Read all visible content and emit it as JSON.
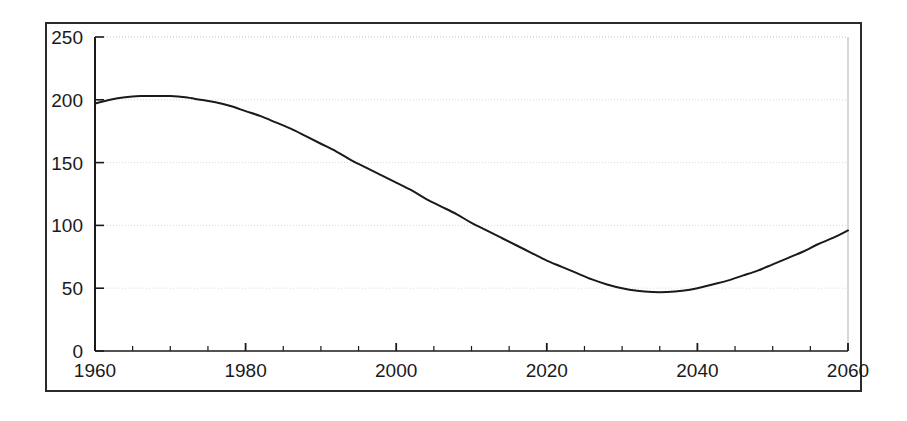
{
  "chart_data": {
    "type": "line",
    "title": "",
    "subtitle": "",
    "xlabel": "",
    "ylabel": "",
    "xlim": [
      1960,
      2060
    ],
    "ylim": [
      0,
      250
    ],
    "grid": true,
    "legend": null,
    "legend_position": "none",
    "x_major_ticks": [
      1960,
      1980,
      2000,
      2020,
      2040,
      2060
    ],
    "x_major_tick_labels": [
      "1960",
      "1980",
      "2000",
      "2020",
      "2040",
      "2060"
    ],
    "x_minor_tick_step": 5,
    "y_major_ticks": [
      0,
      50,
      100,
      150,
      200,
      250
    ],
    "y_major_tick_labels": [
      "0",
      "50",
      "100",
      "150",
      "200",
      "250"
    ],
    "gridline_values": [
      50,
      100,
      150,
      200,
      250
    ],
    "line_color": "#1a1a1a",
    "line_width": 2,
    "series": [
      {
        "name": "series-1",
        "x": [
          1960,
          1962,
          1964,
          1966,
          1968,
          1970,
          1972,
          1974,
          1976,
          1978,
          1980,
          1982,
          1984,
          1986,
          1988,
          1990,
          1992,
          1994,
          1996,
          1998,
          2000,
          2002,
          2004,
          2006,
          2008,
          2010,
          2012,
          2014,
          2016,
          2018,
          2020,
          2022,
          2024,
          2026,
          2028,
          2030,
          2032,
          2034,
          2036,
          2038,
          2040,
          2042,
          2044,
          2046,
          2048,
          2050,
          2052,
          2054,
          2056,
          2058,
          2060
        ],
        "values": [
          197,
          200,
          202,
          203,
          203,
          203,
          202,
          200,
          198,
          195,
          191,
          187,
          182,
          177,
          171,
          165,
          159,
          152,
          146,
          140,
          134,
          128,
          121,
          115,
          109,
          102,
          96,
          90,
          84,
          78,
          72,
          67,
          62,
          57,
          53,
          50,
          48,
          47,
          47,
          48,
          50,
          53,
          56,
          60,
          64,
          69,
          74,
          79,
          85,
          90,
          96
        ]
      }
    ],
    "annotations": {
      "peak_value": 203,
      "peak_year_range": "1966-1970",
      "minimum_value": 47,
      "minimum_year_range": "2032-2036",
      "start_value": 197,
      "end_value": 96
    }
  }
}
